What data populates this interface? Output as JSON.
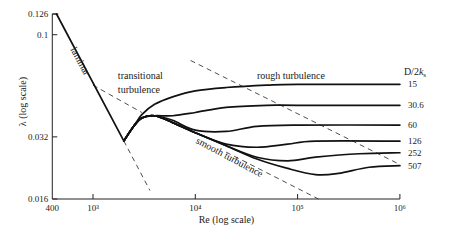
{
  "chart_data": {
    "type": "line",
    "title": "",
    "xlabel": "Re (log scale)",
    "ylabel": "λ (log scale)",
    "xscale": "log",
    "yscale": "log",
    "xlim": [
      400,
      1000000
    ],
    "ylim": [
      0.016,
      0.126
    ],
    "grid": false,
    "x_ticks": [
      {
        "value": 400,
        "label": "400"
      },
      {
        "value": 1000,
        "label": "10³"
      },
      {
        "value": 10000,
        "label": "10⁴"
      },
      {
        "value": 100000,
        "label": "10⁵"
      },
      {
        "value": 1000000,
        "label": "10⁶"
      }
    ],
    "y_ticks": [
      {
        "value": 0.126,
        "label": "0.126"
      },
      {
        "value": 0.1,
        "label": "0.1"
      },
      {
        "value": 0.032,
        "label": "0.032"
      },
      {
        "value": 0.016,
        "label": "0.016"
      }
    ],
    "legend_title": "D/2k_s",
    "legend_title_parts": [
      "D/2",
      "k",
      "s"
    ],
    "annotations": [
      {
        "text": "laminar",
        "x": 600,
        "y": 0.085
      },
      {
        "text": "transitional",
        "x": 1750,
        "y": 0.061
      },
      {
        "text": "turbulence",
        "x": 1750,
        "y": 0.052
      },
      {
        "text": "rough turbulence",
        "x": 40000,
        "y": 0.061
      },
      {
        "text": "smooth turbulence",
        "x": 10000,
        "y": 0.03
      }
    ],
    "laminar": {
      "name": "laminar",
      "points": [
        [
          440,
          0.126
        ],
        [
          2000,
          0.0306
        ]
      ]
    },
    "dashed_lines": [
      {
        "name": "laminar-extension",
        "points": [
          [
            2000,
            0.0306
          ],
          [
            3600,
            0.0176
          ]
        ]
      },
      {
        "name": "smooth-turbulence-extrapolation-back",
        "points": [
          [
            1000,
            0.057
          ],
          [
            3000,
            0.042
          ]
        ]
      },
      {
        "name": "smooth-turbulence-extrapolation",
        "points": [
          [
            20000,
            0.027
          ],
          [
            160000,
            0.016
          ]
        ]
      },
      {
        "name": "rough-boundary",
        "points": [
          [
            9000,
            0.075
          ],
          [
            1000000,
            0.0235
          ]
        ]
      }
    ],
    "series": [
      {
        "name": "15",
        "points": [
          [
            2000,
            0.0306
          ],
          [
            2500,
            0.036
          ],
          [
            3000,
            0.041
          ],
          [
            4000,
            0.046
          ],
          [
            6000,
            0.05
          ],
          [
            10000,
            0.0535
          ],
          [
            20000,
            0.0555
          ],
          [
            50000,
            0.057
          ],
          [
            100000,
            0.0575
          ],
          [
            1000000,
            0.0575
          ]
        ]
      },
      {
        "name": "30.6",
        "points": [
          [
            2000,
            0.0306
          ],
          [
            2500,
            0.036
          ],
          [
            3000,
            0.0395
          ],
          [
            4000,
            0.0405
          ],
          [
            6000,
            0.0405
          ],
          [
            10000,
            0.042
          ],
          [
            20000,
            0.0445
          ],
          [
            50000,
            0.0455
          ],
          [
            100000,
            0.0455
          ],
          [
            1000000,
            0.0455
          ]
        ]
      },
      {
        "name": "60",
        "points": [
          [
            2000,
            0.0306
          ],
          [
            2500,
            0.036
          ],
          [
            3000,
            0.0395
          ],
          [
            4000,
            0.0405
          ],
          [
            6000,
            0.0385
          ],
          [
            10000,
            0.0345
          ],
          [
            20000,
            0.034
          ],
          [
            40000,
            0.036
          ],
          [
            100000,
            0.0365
          ],
          [
            1000000,
            0.0365
          ]
        ]
      },
      {
        "name": "126",
        "points": [
          [
            2000,
            0.0306
          ],
          [
            2500,
            0.036
          ],
          [
            3000,
            0.0395
          ],
          [
            4000,
            0.0405
          ],
          [
            6000,
            0.0375
          ],
          [
            10000,
            0.0335
          ],
          [
            20000,
            0.0295
          ],
          [
            40000,
            0.0285
          ],
          [
            80000,
            0.0295
          ],
          [
            150000,
            0.0305
          ],
          [
            1000000,
            0.0305
          ]
        ]
      },
      {
        "name": "252",
        "points": [
          [
            2000,
            0.0306
          ],
          [
            2500,
            0.036
          ],
          [
            3000,
            0.0395
          ],
          [
            4000,
            0.0405
          ],
          [
            6000,
            0.0375
          ],
          [
            10000,
            0.0335
          ],
          [
            20000,
            0.029
          ],
          [
            40000,
            0.0255
          ],
          [
            80000,
            0.0245
          ],
          [
            150000,
            0.0255
          ],
          [
            400000,
            0.0265
          ],
          [
            1000000,
            0.0268
          ]
        ]
      },
      {
        "name": "507",
        "points": [
          [
            2000,
            0.0306
          ],
          [
            2500,
            0.036
          ],
          [
            3000,
            0.0395
          ],
          [
            4000,
            0.0405
          ],
          [
            6000,
            0.0375
          ],
          [
            10000,
            0.0335
          ],
          [
            20000,
            0.029
          ],
          [
            40000,
            0.025
          ],
          [
            80000,
            0.0225
          ],
          [
            150000,
            0.021
          ],
          [
            250000,
            0.0213
          ],
          [
            500000,
            0.0228
          ],
          [
            1000000,
            0.0232
          ]
        ]
      }
    ]
  }
}
